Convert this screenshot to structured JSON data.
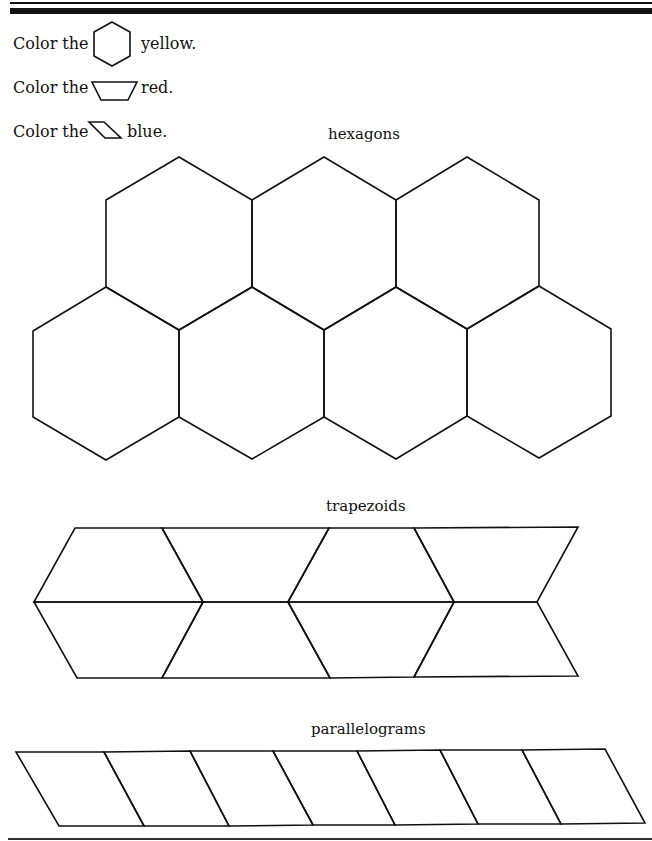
{
  "instructions": [
    {
      "prefix": "Color the",
      "shape": "hexagon",
      "color_word": "yellow."
    },
    {
      "prefix": "Color the",
      "shape": "trapezoid",
      "color_word": "red."
    },
    {
      "prefix": "Color the",
      "shape": "parallelogram",
      "color_word": "blue."
    }
  ],
  "sections": {
    "hexagons": {
      "caption": "hexagons",
      "count": 7
    },
    "trapezoids": {
      "caption": "trapezoids",
      "count": 8
    },
    "parallelograms": {
      "caption": "parallelograms",
      "count": 7
    }
  }
}
